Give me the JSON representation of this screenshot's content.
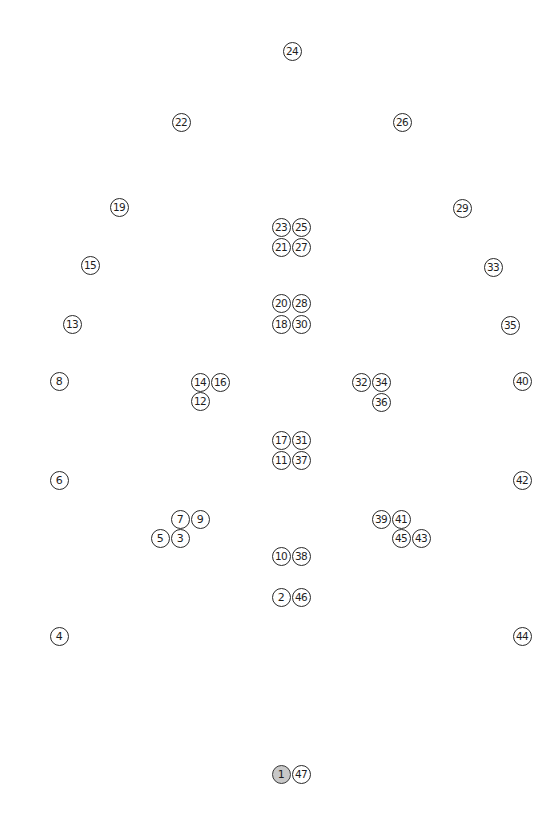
{
  "diagram": {
    "type": "numbered-point-map",
    "selected_point": "1",
    "colors": {
      "background": "#ffffff",
      "marker_border": "#2a2a2a",
      "marker_fill": "#ffffff",
      "marker_selected_fill": "#c8c8c8",
      "text": "#1e1e1e"
    },
    "points": [
      {
        "label": "1",
        "x": 281,
        "y": 774,
        "selected": true
      },
      {
        "label": "2",
        "x": 281,
        "y": 597
      },
      {
        "label": "3",
        "x": 180,
        "y": 538
      },
      {
        "label": "4",
        "x": 59,
        "y": 636
      },
      {
        "label": "5",
        "x": 160,
        "y": 538
      },
      {
        "label": "6",
        "x": 59,
        "y": 480
      },
      {
        "label": "7",
        "x": 180,
        "y": 519
      },
      {
        "label": "8",
        "x": 59,
        "y": 381
      },
      {
        "label": "9",
        "x": 200,
        "y": 519
      },
      {
        "label": "10",
        "x": 281,
        "y": 556
      },
      {
        "label": "11",
        "x": 281,
        "y": 460
      },
      {
        "label": "12",
        "x": 200,
        "y": 401
      },
      {
        "label": "13",
        "x": 72,
        "y": 324
      },
      {
        "label": "14",
        "x": 200,
        "y": 382
      },
      {
        "label": "15",
        "x": 90,
        "y": 265
      },
      {
        "label": "16",
        "x": 220,
        "y": 382
      },
      {
        "label": "17",
        "x": 281,
        "y": 440
      },
      {
        "label": "18",
        "x": 281,
        "y": 324
      },
      {
        "label": "19",
        "x": 119,
        "y": 207
      },
      {
        "label": "20",
        "x": 281,
        "y": 303
      },
      {
        "label": "21",
        "x": 281,
        "y": 247
      },
      {
        "label": "22",
        "x": 181,
        "y": 122
      },
      {
        "label": "23",
        "x": 281,
        "y": 227
      },
      {
        "label": "24",
        "x": 292,
        "y": 51
      },
      {
        "label": "25",
        "x": 301,
        "y": 227
      },
      {
        "label": "26",
        "x": 402,
        "y": 122
      },
      {
        "label": "27",
        "x": 301,
        "y": 247
      },
      {
        "label": "28",
        "x": 301,
        "y": 303
      },
      {
        "label": "29",
        "x": 462,
        "y": 208
      },
      {
        "label": "30",
        "x": 301,
        "y": 324
      },
      {
        "label": "31",
        "x": 301,
        "y": 440
      },
      {
        "label": "32",
        "x": 361,
        "y": 382
      },
      {
        "label": "33",
        "x": 493,
        "y": 267
      },
      {
        "label": "34",
        "x": 381,
        "y": 382
      },
      {
        "label": "35",
        "x": 510,
        "y": 325
      },
      {
        "label": "36",
        "x": 381,
        "y": 402
      },
      {
        "label": "37",
        "x": 301,
        "y": 460
      },
      {
        "label": "38",
        "x": 301,
        "y": 556
      },
      {
        "label": "39",
        "x": 381,
        "y": 519
      },
      {
        "label": "40",
        "x": 522,
        "y": 381
      },
      {
        "label": "41",
        "x": 401,
        "y": 519
      },
      {
        "label": "42",
        "x": 522,
        "y": 480
      },
      {
        "label": "43",
        "x": 421,
        "y": 538
      },
      {
        "label": "44",
        "x": 522,
        "y": 636
      },
      {
        "label": "45",
        "x": 401,
        "y": 538
      },
      {
        "label": "46",
        "x": 301,
        "y": 597
      },
      {
        "label": "47",
        "x": 301,
        "y": 774
      }
    ]
  }
}
